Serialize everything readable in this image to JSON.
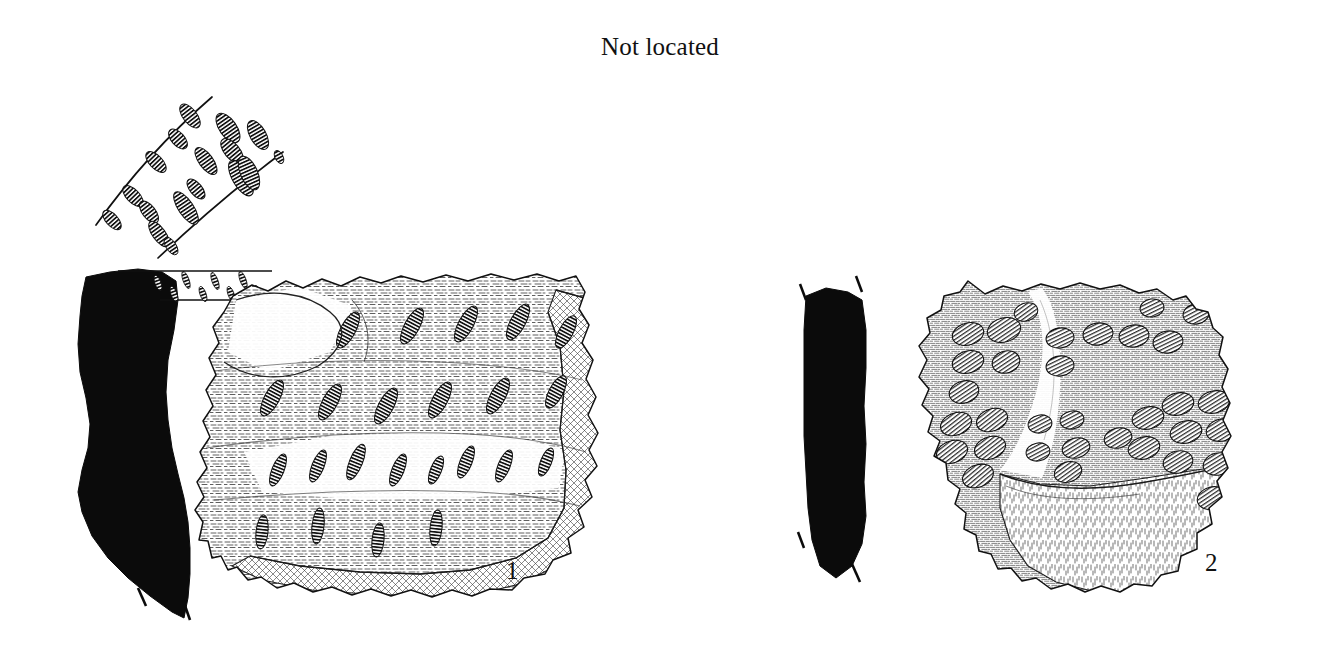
{
  "plate": {
    "title": "Not located",
    "background_color": "#ffffff",
    "ink_color": "#111111",
    "width": 1320,
    "height": 667,
    "medium": "archaeological ink drawing",
    "subject": "two decorated pottery sherds with section profiles"
  },
  "figures": [
    {
      "id": "figure-1",
      "label": "1",
      "label_position": {
        "x": 506,
        "y": 558
      },
      "description": "Large rim/body sherd with rows of diagonal impressed oval (comb-stamped) motifs, drawn with stippled surface texture and a thick broken fracture edge at right and bottom.",
      "parts": [
        {
          "name": "section-profile",
          "fill": "solid-black",
          "description": "S-curved vessel wall section filled solid black, with short dashed break-lines at the lower terminus."
        },
        {
          "name": "rim-band-detail-strip",
          "description": "Narrow horizontal band between profile and sherd showing the rim decoration in elevation."
        },
        {
          "name": "decorated-sherd-face",
          "description": "Outer face of the sherd with four horizontal registers of oblique ladder-hatched oval impressions."
        },
        {
          "name": "enlarged-decoration-detail",
          "description": "Separate enlargement above the profile: two curved guide arcs enclosing a band of teardrop shaped comb impressions."
        }
      ],
      "decoration_motif": "oblique ladder-hatched oval comb impressions in horizontal rows"
    },
    {
      "id": "figure-2",
      "label": "2",
      "label_position": {
        "x": 1205,
        "y": 550
      },
      "description": "Rounded body sherd covered with rows of oval punctate bosses/impressions, shaded with fine parallel hatching; lower-left area is a stepped break surface.",
      "parts": [
        {
          "name": "section-profile",
          "fill": "solid-black",
          "description": "Narrow, nearly straight vessel wall section filled solid black, with dashed break-lines at top and bottom on both edges."
        },
        {
          "name": "decorated-sherd-face",
          "description": "Convex outer face with dense rows of oval impressed bosses and a lighter unhatched highlight running down the centre."
        },
        {
          "name": "fracture-step",
          "description": "Lower-right stepped break surface rendered in short vertical strokes."
        }
      ],
      "decoration_motif": "rows of oval punctate / bossed impressions"
    }
  ],
  "annotations": {
    "break_line_style": "short dashed strokes",
    "section_convention": "solid black section with profile drawn to the left of the view",
    "scale_bar_present": false,
    "caption_present": false
  }
}
